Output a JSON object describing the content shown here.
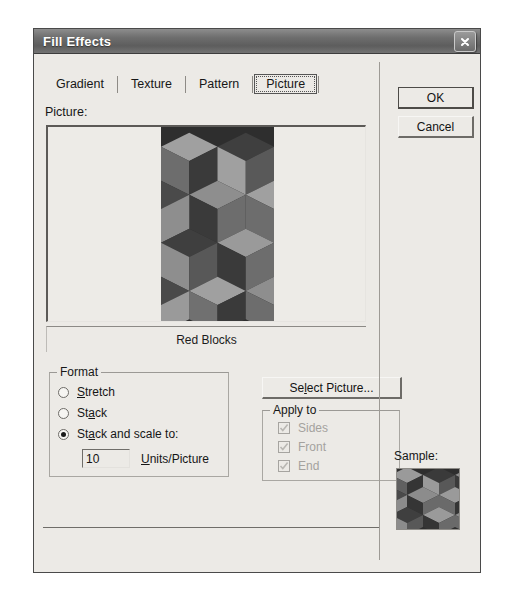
{
  "window": {
    "title": "Fill Effects",
    "close_icon": "close-x-icon"
  },
  "tabs": [
    {
      "label": "Gradient",
      "selected": false
    },
    {
      "label": "Texture",
      "selected": false
    },
    {
      "label": "Pattern",
      "selected": false
    },
    {
      "label": "Picture",
      "selected": true
    }
  ],
  "picture_section": {
    "label": "Picture:",
    "caption": "Red Blocks"
  },
  "format_group": {
    "title": "Format",
    "options": [
      {
        "label": "Stretch",
        "accel": "S",
        "selected": false
      },
      {
        "label": "Stack",
        "accel": "a",
        "selected": false
      },
      {
        "label": "Stack and scale to:",
        "accel": "a",
        "selected": true
      }
    ],
    "units_value": "10",
    "units_label": "Units/Picture",
    "units_accel": "U"
  },
  "apply_to_group": {
    "title": "Apply to",
    "items": [
      {
        "label": "Sides",
        "checked": true,
        "disabled": true
      },
      {
        "label": "Front",
        "checked": true,
        "disabled": true
      },
      {
        "label": "End",
        "checked": true,
        "disabled": true
      }
    ]
  },
  "buttons": {
    "select_picture": "Select Picture...",
    "select_picture_accel": "l",
    "ok": "OK",
    "cancel": "Cancel"
  },
  "sample": {
    "label": "Sample:"
  },
  "colors": {
    "titlebar": "#6e6e6e",
    "dialog_face": "#eceae6",
    "text": "#171717",
    "disabled_text": "#a4a29e",
    "pattern_dark": "#2b2b2b",
    "pattern_mid": "#6a6a6a",
    "pattern_light": "#9e9e9e"
  }
}
